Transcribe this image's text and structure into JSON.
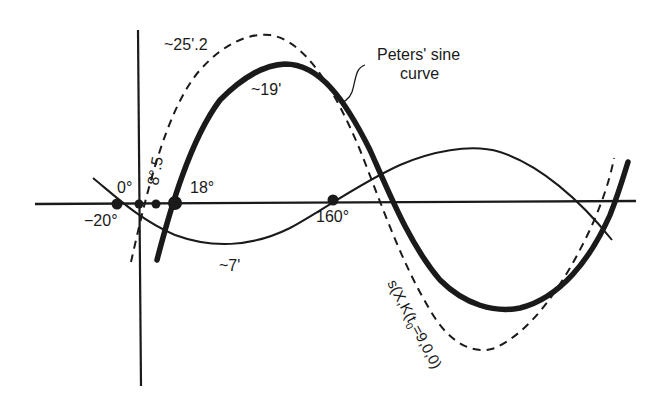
{
  "figure": {
    "title_label": "Peters' sine curve",
    "title_line1": "Peters' sine",
    "title_line2": "curve"
  },
  "labels": {
    "minus20": "−20°",
    "zero": "0°",
    "eight5": "8°.5",
    "eighteen": "18°",
    "one60": "160°",
    "amp_dashed": "~25'.2",
    "amp_bold": "~19'",
    "amp_thin": "~7'",
    "dashed_curve": "s(X,K(t",
    "dashed_sub": "0",
    "dashed_tail": "=9,0,0)"
  },
  "colors": {
    "ink": "#1a1a1a",
    "background": "#ffffff"
  },
  "curves": [
    {
      "name": "peters-sine-curve",
      "style": "bold",
      "amplitude_label": "~19'"
    },
    {
      "name": "dashed-curve",
      "style": "dashed",
      "amplitude_label": "~25'.2"
    },
    {
      "name": "thin-curve",
      "style": "thin",
      "amplitude_label": "~7'"
    }
  ],
  "intersection_points_deg": [
    -20,
    0,
    8.5,
    18,
    160
  ]
}
